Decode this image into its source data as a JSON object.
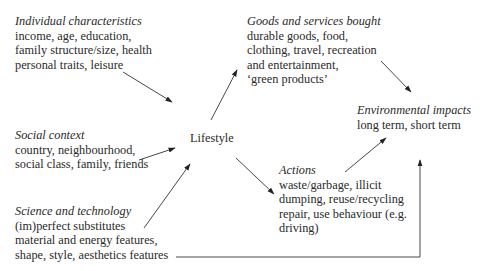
{
  "diagram": {
    "nodes": {
      "individual": {
        "title": "Individual characteristics",
        "lines": [
          "income, age, education,",
          "family structure/size, health",
          "personal traits, leisure"
        ]
      },
      "goods": {
        "title": "Goods and services bought",
        "lines": [
          "durable goods, food,",
          "clothing, travel, recreation",
          "and entertainment,",
          "‘green products’"
        ]
      },
      "social": {
        "title": "Social context",
        "lines": [
          "country, neighbourhood,",
          "social class, family, friends"
        ]
      },
      "lifestyle": {
        "label": "Lifestyle"
      },
      "environmental": {
        "title": "Environmental impacts",
        "lines": [
          "long term, short term"
        ]
      },
      "actions": {
        "title": "Actions",
        "lines": [
          "waste/garbage, illicit",
          "dumping, reuse/recycling",
          "repair, use behaviour (e.g.",
          "driving)"
        ]
      },
      "science": {
        "title": "Science and technology",
        "lines": [
          "(im)perfect substitutes",
          "material and energy features,",
          "shape, style, aesthetics features"
        ]
      }
    },
    "edges": [
      {
        "from": "Individual characteristics",
        "to": "Lifestyle"
      },
      {
        "from": "Social context",
        "to": "Lifestyle"
      },
      {
        "from": "Science and technology",
        "to": "Lifestyle"
      },
      {
        "from": "Lifestyle",
        "to": "Goods and services bought"
      },
      {
        "from": "Lifestyle",
        "to": "Actions"
      },
      {
        "from": "Goods and services bought",
        "to": "Environmental impacts"
      },
      {
        "from": "Actions",
        "to": "Environmental impacts"
      },
      {
        "from": "Science and technology",
        "to": "Environmental impacts"
      }
    ],
    "colors": {
      "text": "#2a2a2a",
      "line": "#333333",
      "background": "#ffffff"
    }
  }
}
